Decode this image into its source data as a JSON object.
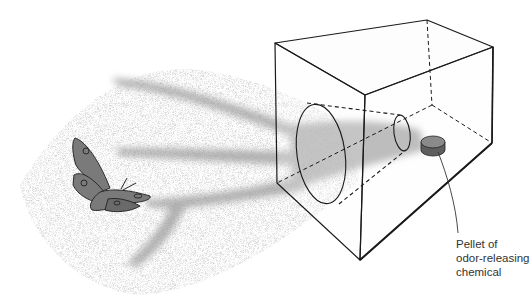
{
  "figure": {
    "elements": [
      "moth-icon",
      "odor-plume",
      "box",
      "funnel-cone",
      "pellet"
    ],
    "colors": {
      "line": "#1a1a1a",
      "plume": "#9a9a9a",
      "plume_speckle": "#b0b0b0",
      "moth_fill": "#7a7a7a",
      "pellet_fill": "#7f7f7f",
      "box_face": "#f7f7f7"
    }
  },
  "annotation": {
    "lines": [
      "Pellet of",
      "odor-releasing",
      "chemical"
    ]
  }
}
